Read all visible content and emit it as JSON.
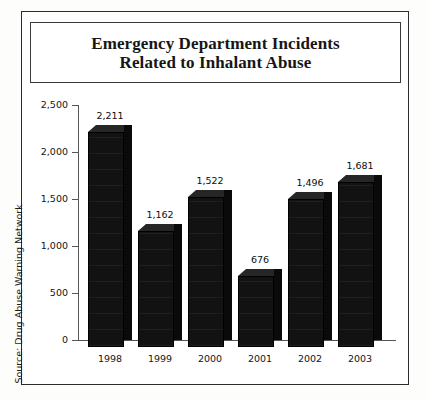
{
  "figure": {
    "title_line1": "Emergency Department Incidents",
    "title_line2": "Related to Inhalant Abuse",
    "title_full": "Emergency Department Incidents\nRelated to Inhalant Abuse",
    "source_note": "Source: Drug Abuse Warning Network"
  },
  "colors": {
    "bar_front": "#121212",
    "bar_top": "#262626",
    "bar_side": "#0a0a0a",
    "frame": "#2b2b2b",
    "axis": "#555555",
    "text": "#141414",
    "background": "#ffffff"
  },
  "chart_data": {
    "type": "bar",
    "title": "Emergency Department Incidents Related to Inhalant Abuse",
    "xlabel": "",
    "ylabel": "",
    "categories": [
      "1998",
      "1999",
      "2000",
      "2001",
      "2002",
      "2003"
    ],
    "values": [
      2211,
      1162,
      1522,
      676,
      1496,
      1681
    ],
    "value_labels": [
      "2,211",
      "1,162",
      "1,522",
      "676",
      "1,496",
      "1,681"
    ],
    "ylim": [
      0,
      2500
    ],
    "ytick_values": [
      0,
      500,
      1000,
      1500,
      2000,
      2500
    ],
    "ytick_labels": [
      "0",
      "500",
      "1,000",
      "1,500",
      "2,000",
      "2,500"
    ],
    "grid": false,
    "legend": null,
    "source": "Source: Drug Abuse Warning Network",
    "style": "3d-block-bars"
  }
}
